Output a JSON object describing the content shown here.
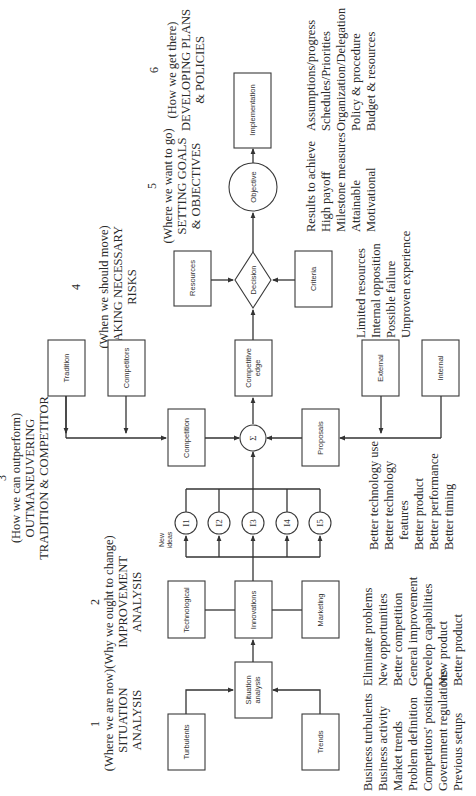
{
  "stages": [
    {
      "num": "1",
      "question": "(Where we are now)",
      "title_lines": [
        "SITUATION",
        "ANALYSIS"
      ]
    },
    {
      "num": "2",
      "question": "(Why we ought to change)",
      "title_lines": [
        "IMPROVEMENT",
        "ANALYSIS"
      ]
    },
    {
      "num": "3",
      "question": "(How we can outperform)",
      "title_lines": [
        "OUTMANEUVERING",
        "TRADITION & COMPETITOR"
      ]
    },
    {
      "num": "4",
      "question": "(When we should move)",
      "title_lines": [
        "TAKING NECESSARY",
        "RISKS"
      ]
    },
    {
      "num": "5",
      "question": "(Where we want to go)",
      "title_lines": [
        "SETTING GOALS",
        "& OBJECTIVES"
      ]
    },
    {
      "num": "6",
      "question": "(How we get there)",
      "title_lines": [
        "DEVELOPING PLANS",
        "& POLICIES"
      ]
    }
  ],
  "nodes": {
    "turbulents": "Turbulents",
    "trends": "Trends",
    "situation_analysis": [
      "Situation",
      "analysis"
    ],
    "technological": "Technological",
    "innovations": "Innovations",
    "marketing": "Marketing",
    "new_ideas": [
      "New",
      "ideas"
    ],
    "ideas": [
      "I1",
      "I2",
      "I3",
      "I4",
      "I5"
    ],
    "tradition": "Tradition",
    "competitors": "Competitors",
    "competition": "Competition",
    "sigma": "Σ",
    "proposals": "Proposals",
    "external": "External",
    "internal": "Internal",
    "competitive_edge": [
      "Competitive",
      "edge"
    ],
    "resources": "Resources",
    "decision": "Decision",
    "criteria": "Criteria",
    "objective": "Objective",
    "implementation": "Implementation"
  },
  "lists": {
    "situation": [
      "Business turbulents",
      "Business activity",
      "Market trends",
      "Problem definition",
      "Competitors' position",
      "Government regulations",
      "Previous setups"
    ],
    "improvement": [
      "Eliminate problems",
      "New opportunities",
      "Better competition",
      "General improvement",
      "Develop capabilities",
      "New product",
      "Better product"
    ],
    "outmaneuvering": [
      "Better technology use",
      "Better technology",
      "   features",
      "Better product",
      "Better performance",
      "Better timing"
    ],
    "risks": [
      "Limited resources",
      "Internal opposition",
      "Possible failure",
      "Unproven experience"
    ],
    "goals": [
      "Results to achieve",
      "High payoff",
      "Milestone measures",
      "Attainable",
      "Motivational"
    ],
    "plans": [
      "Assumptions/progress",
      "Schedules/Priorities",
      "Organization/Delegation",
      "Policy & procedure",
      "Budget & resources"
    ]
  }
}
